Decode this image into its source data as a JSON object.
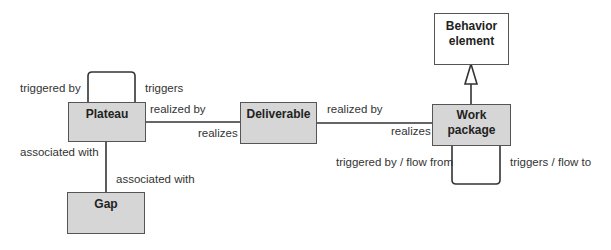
{
  "diagram": {
    "nodes": {
      "plateau": {
        "label": "Plateau"
      },
      "gap": {
        "label": "Gap"
      },
      "deliverable": {
        "label": "Deliverable"
      },
      "work_package": {
        "label": "Work package",
        "line1": "Work",
        "line2": "package"
      },
      "behavior_element": {
        "label": "Behavior element",
        "line1": "Behavior",
        "line2": "element"
      }
    },
    "edges": {
      "plateau_self": {
        "source_label": "triggered by",
        "target_label": "triggers"
      },
      "plateau_deliverable": {
        "near_plateau": "realized by",
        "near_deliverable": "realizes"
      },
      "plateau_gap": {
        "near_plateau": "associated with",
        "near_gap": "associated with"
      },
      "deliverable_work_package": {
        "near_deliverable": "realized by",
        "near_work_package": "realizes"
      },
      "work_package_self": {
        "source_label": "triggered by / flow from",
        "target_label": "triggers / flow to"
      },
      "work_package_behavior": {
        "type": "specialization"
      }
    },
    "colors": {
      "node_fill": "#d6d6d6",
      "node_border": "#555555",
      "generalization_fill": "#ffffff",
      "edge": "#333333"
    }
  }
}
